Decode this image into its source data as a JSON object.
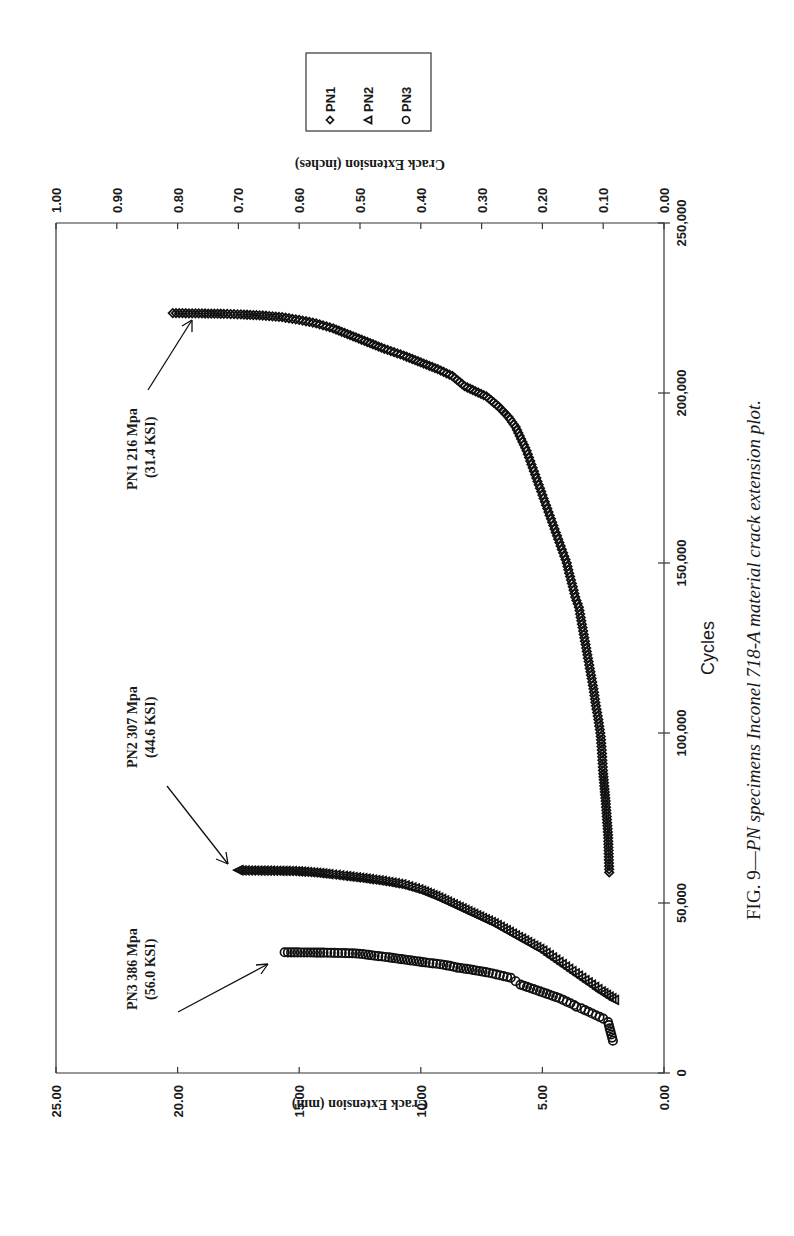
{
  "caption": {
    "prefix": "FIG. 9—",
    "italic": "PN specimens Inconel 718-A material crack extension plot."
  },
  "legend": {
    "items": [
      {
        "label": "PN1",
        "marker": "diamond"
      },
      {
        "label": "PN2",
        "marker": "triangle"
      },
      {
        "label": "PN3",
        "marker": "circle"
      }
    ]
  },
  "annotations": [
    {
      "series": "PN1",
      "line1": "PN1 216 Mpa",
      "line2": "(31.4 KSI)"
    },
    {
      "series": "PN2",
      "line1": "PN2 307 Mpa",
      "line2": "(44.6 KSI)"
    },
    {
      "series": "PN3",
      "line1": "PN3 386 Mpa",
      "line2": "(56.0 KSI)"
    }
  ],
  "chart_data": {
    "type": "scatter",
    "title": "FIG. 9—PN specimens Inconel 718-A material crack extension plot.",
    "orientation_note": "page rotated 90 degrees counter-clockwise",
    "xlabel": "Cycles",
    "ylabel": "Crack Extension (mm)",
    "y2label": "Crack Extension (inches)",
    "xlim": [
      0,
      250000
    ],
    "ylim": [
      0,
      25
    ],
    "y2lim": [
      0,
      1.0
    ],
    "x_ticks": [
      "0",
      "50,000",
      "100,000",
      "150,000",
      "200,000",
      "250,000"
    ],
    "y_ticks": [
      "0.00",
      "5.00",
      "10.00",
      "15.00",
      "20.00",
      "25.00"
    ],
    "y2_ticks": [
      "0.00",
      "0.10",
      "0.20",
      "0.30",
      "0.40",
      "0.50",
      "0.60",
      "0.70",
      "0.80",
      "0.90",
      "1.00"
    ],
    "grid": false,
    "legend_position": "upper-right (outside plot)",
    "series": [
      {
        "name": "PN1",
        "marker": "diamond",
        "stress": "216 Mpa (31.4 KSI)",
        "x": [
          59000,
          70000,
          80000,
          88000,
          94000,
          99000,
          104000,
          108000,
          113000,
          117000,
          121000,
          125000,
          129000,
          133000,
          137000,
          140000,
          143000,
          147000,
          150000,
          153000,
          156000,
          159000,
          162000,
          165000,
          168000,
          171000,
          174000,
          177000,
          180000,
          183000,
          190000,
          193000,
          196000,
          199000,
          202000,
          205000,
          207000,
          209000,
          211000,
          213000,
          215000,
          217000,
          219000,
          220500,
          221500,
          222300,
          222800,
          223100,
          223300,
          223400,
          223500
        ],
        "y": [
          2.25,
          2.3,
          2.4,
          2.5,
          2.55,
          2.6,
          2.7,
          2.8,
          2.9,
          3.0,
          3.1,
          3.2,
          3.3,
          3.4,
          3.5,
          3.65,
          3.75,
          3.9,
          4.0,
          4.15,
          4.3,
          4.45,
          4.6,
          4.75,
          4.9,
          5.05,
          5.2,
          5.35,
          5.5,
          5.65,
          6.1,
          6.4,
          6.8,
          7.3,
          8.2,
          8.7,
          9.3,
          10.0,
          10.7,
          11.5,
          12.2,
          12.9,
          13.6,
          14.3,
          15.0,
          15.7,
          16.5,
          17.4,
          18.1,
          19.0,
          20.2
        ]
      },
      {
        "name": "PN2",
        "marker": "triangle",
        "stress": "307 Mpa (44.6 KSI)",
        "x": [
          21500,
          24000,
          26000,
          28000,
          30000,
          32000,
          34000,
          36000,
          38000,
          40000,
          42000,
          44000,
          46000,
          48000,
          50000,
          52000,
          54000,
          55500,
          56500,
          57300,
          58000,
          58500,
          58900,
          59200,
          59400,
          59500,
          59600,
          59700
        ],
        "y": [
          2.05,
          2.6,
          3.0,
          3.4,
          3.8,
          4.2,
          4.6,
          5.0,
          5.5,
          6.0,
          6.5,
          7.0,
          7.6,
          8.2,
          8.8,
          9.4,
          10.1,
          10.8,
          11.6,
          12.4,
          13.2,
          13.8,
          14.3,
          14.8,
          15.3,
          16.2,
          17.5,
          17.5
        ]
      },
      {
        "name": "PN3",
        "marker": "circle",
        "stress": "386 Mpa (56.0 KSI)",
        "x": [
          9500,
          15000,
          16000,
          17000,
          18000,
          19000,
          19500,
          20000,
          21000,
          22000,
          23000,
          24000,
          25000,
          26000,
          27000,
          28000,
          28500,
          29000,
          29500,
          30500,
          31000,
          31500,
          32000,
          32500,
          33000,
          33500,
          34000,
          34500,
          35000,
          35200,
          35300,
          35400,
          35500
        ],
        "y": [
          2.1,
          2.3,
          2.5,
          2.8,
          3.1,
          3.4,
          3.6,
          3.7,
          4.0,
          4.3,
          4.7,
          5.1,
          5.5,
          5.9,
          6.1,
          6.3,
          6.6,
          6.9,
          7.2,
          8.0,
          8.5,
          8.8,
          9.2,
          9.8,
          10.3,
          10.8,
          11.3,
          11.9,
          12.4,
          12.8,
          13.4,
          14.0,
          15.6
        ]
      }
    ]
  }
}
